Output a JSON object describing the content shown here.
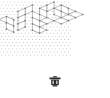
{
  "figure": {
    "background_color": "#ffffff",
    "width": 110,
    "height": 98,
    "lattice": {
      "dot_color": "#c9c9c9",
      "dot_radius": 0.6,
      "spacing_x": 7.2,
      "spacing_y": 6.24,
      "visible": true
    },
    "style": {
      "edge_color": "#8a8a8a",
      "edge_width": 0.55,
      "vertex_color": "#7a7a7a",
      "vertex_radius": 0.85,
      "face_fill": "#ffffff"
    },
    "panels": [
      {
        "name": "left-tiling",
        "label": "",
        "origin_x": -8,
        "origin_y": 4,
        "cols": 7,
        "rows": 7,
        "description": "Partially clipped stacked-cube lozenge tiling, cropped at the left image border"
      },
      {
        "name": "right-tiling",
        "label": "",
        "origin_x": 54,
        "origin_y": 2,
        "cols": 8,
        "rows": 8,
        "description": "Full stacked-cube lozenge tiling with staircase boundary"
      }
    ],
    "glyph": {
      "name": "trash-glyph",
      "char": "☗",
      "color": "#2b2b2b",
      "x": 48,
      "y": 76,
      "width": 14,
      "height": 13
    }
  },
  "chart_data": {
    "type": "diagram",
    "xlabel": "",
    "ylabel": "",
    "panel_count": 2,
    "panels": [
      {
        "id": "left",
        "title": "",
        "lozenges": [
          {
            "orientation": "left",
            "x": 0,
            "y": 2
          },
          {
            "orientation": "right",
            "x": 1,
            "y": 1
          },
          {
            "orientation": "top",
            "x": 1,
            "y": 3
          },
          {
            "orientation": "left",
            "x": 1,
            "y": 4
          },
          {
            "orientation": "right",
            "x": 2,
            "y": 2
          },
          {
            "orientation": "top",
            "x": 2,
            "y": 4
          },
          {
            "orientation": "left",
            "x": 2,
            "y": 5
          },
          {
            "orientation": "right",
            "x": 3,
            "y": 3
          },
          {
            "orientation": "top",
            "x": 3,
            "y": 1
          },
          {
            "orientation": "left",
            "x": 3,
            "y": 5
          },
          {
            "orientation": "right",
            "x": 4,
            "y": 2
          },
          {
            "orientation": "top",
            "x": 4,
            "y": 4
          },
          {
            "orientation": "left",
            "x": 4,
            "y": 6
          },
          {
            "orientation": "right",
            "x": 5,
            "y": 3
          },
          {
            "orientation": "top",
            "x": 5,
            "y": 5
          }
        ]
      },
      {
        "id": "right",
        "title": "",
        "lozenges": [
          {
            "orientation": "top",
            "x": 1,
            "y": 0
          },
          {
            "orientation": "top",
            "x": 2,
            "y": 0
          },
          {
            "orientation": "top",
            "x": 3,
            "y": 0
          },
          {
            "orientation": "left",
            "x": 1,
            "y": 1
          },
          {
            "orientation": "right",
            "x": 2,
            "y": 1
          },
          {
            "orientation": "top",
            "x": 3,
            "y": 1
          },
          {
            "orientation": "left",
            "x": 1,
            "y": 2
          },
          {
            "orientation": "right",
            "x": 2,
            "y": 2
          },
          {
            "orientation": "top",
            "x": 3,
            "y": 2
          },
          {
            "orientation": "left",
            "x": 0,
            "y": 3
          },
          {
            "orientation": "right",
            "x": 1,
            "y": 3
          },
          {
            "orientation": "top",
            "x": 2,
            "y": 3
          },
          {
            "orientation": "left",
            "x": 0,
            "y": 4
          },
          {
            "orientation": "right",
            "x": 1,
            "y": 4
          },
          {
            "orientation": "top",
            "x": 2,
            "y": 4
          },
          {
            "orientation": "left",
            "x": 1,
            "y": 5
          },
          {
            "orientation": "right",
            "x": 2,
            "y": 5
          },
          {
            "orientation": "top",
            "x": 3,
            "y": 5
          },
          {
            "orientation": "left",
            "x": 2,
            "y": 6
          },
          {
            "orientation": "right",
            "x": 3,
            "y": 6
          }
        ]
      }
    ],
    "legend": [],
    "grid": true
  }
}
